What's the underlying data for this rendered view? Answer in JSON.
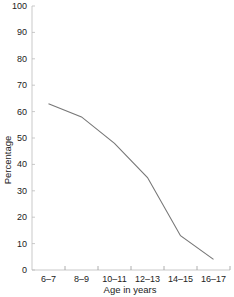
{
  "chart_data": {
    "type": "line",
    "title": "",
    "xlabel": "Age in years",
    "ylabel": "Percentage",
    "categories": [
      "6–7",
      "8–9",
      "10–11",
      "12–13",
      "14–15",
      "16–17"
    ],
    "series": [
      {
        "name": "Percentage",
        "values": [
          63,
          58,
          48,
          35,
          13,
          4
        ]
      }
    ],
    "ylim": [
      0,
      100
    ],
    "yticks": [
      0,
      10,
      20,
      30,
      40,
      50,
      60,
      70,
      80,
      90,
      100
    ],
    "grid": false,
    "legend": null
  },
  "style": {
    "line_color": "#777777",
    "axis_color": "#bbbbbb",
    "text_color": "#222222"
  }
}
